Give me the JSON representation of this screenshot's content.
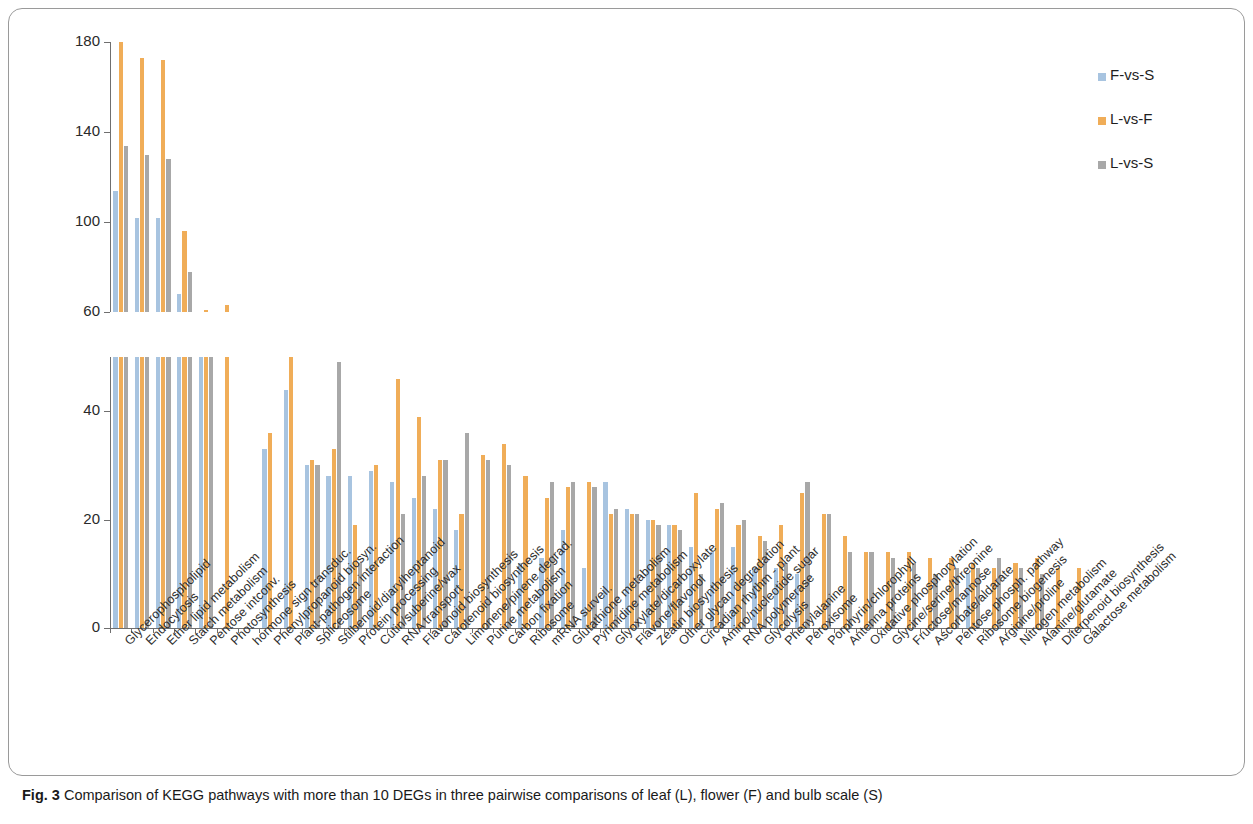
{
  "figure": {
    "caption_label": "Fig. 3",
    "caption_text": " Comparison of KEGG pathways with more than 10 DEGs in three pairwise comparisons of leaf (L), flower (F) and bulb scale (S)"
  },
  "legend": {
    "position": "right",
    "entries": [
      {
        "label": "F-vs-S",
        "color": "#a8c4e0"
      },
      {
        "label": "L-vs-F",
        "color": "#f0ad58"
      },
      {
        "label": "L-vs-S",
        "color": "#a8a8a8"
      }
    ]
  },
  "axes": {
    "upper": {
      "ticks": [
        "180",
        "140",
        "100",
        "60"
      ],
      "ylim": [
        60,
        180
      ]
    },
    "lower": {
      "ticks": [
        "40",
        "20",
        "0"
      ],
      "ylim": [
        0,
        50
      ]
    },
    "xlabel": "",
    "ylabel": "",
    "grid": false,
    "broken_axis": true
  },
  "chart_data": {
    "type": "bar",
    "title": "Comparison of KEGG pathways with more than 10 DEGs in three pairwise comparisons of leaf (L), flower (F) and bulb scale (S)",
    "xlabel": "",
    "ylabel": "Number of DEGs",
    "ylim_lower": [
      0,
      50
    ],
    "ylim_upper": [
      60,
      180
    ],
    "broken_axis": true,
    "grid": false,
    "legend_position": "right",
    "categories": [
      "Glycerophospholipid",
      "Endocytosis",
      "Ether lipid metabolism",
      "Starch metabolism",
      "Pentose intconv.",
      "Photosynthesis",
      "hormone sign transduc.",
      "Phenylpropanoid biosyn.",
      "Plant-pathogen interaction",
      "Spliceosome",
      "Stilbenoid/diarylheptanoid",
      "Protein processing",
      "Cutin/suberine/wax",
      "RNA transport",
      "Flavonoid biosynthesis",
      "Carotenoid biosynthesis",
      "Limonene/pinene degrad.",
      "Purine metabolism",
      "Carbon fixation",
      "Ribosome",
      "mRNA surveil.",
      "Glutathione metabolism",
      "Pyrimidine metabolism",
      "Glyoxylate/dicarboxylate",
      "Flavone/flavonol",
      "Zeatin biosynthesis",
      "Other glycan degradation",
      "Circadian rhythm - plant",
      "Amino/nucleotide sugar",
      "RNA polymerase",
      "Glycolysis",
      "Phenylalanine",
      "Peroxisome",
      "Porphyrin/chlorophyll",
      "Antenna proteins",
      "Oxidative phosphorylation",
      "Glycine/serine/threonine",
      "Fructose/mannose",
      "Ascorbate/aldarate",
      "Pentose phosph. pathway",
      "Ribosome biogenesis",
      "Arginine/proline",
      "Nitrogen metabolism",
      "Alanine/glutamate",
      "Diterpenoid biosynthesis",
      "Galactose metabolism"
    ],
    "series": [
      {
        "name": "F-vs-S",
        "color": "#a8c4e0",
        "values": [
          114,
          102,
          102,
          68,
          60,
          0,
          0,
          33,
          44,
          30,
          28,
          28,
          29,
          27,
          24,
          22,
          18,
          0,
          0,
          12,
          13,
          18,
          11,
          27,
          22,
          20,
          19,
          15,
          14,
          15,
          11,
          11,
          10,
          0,
          0,
          0,
          0,
          0,
          0,
          0,
          10,
          0,
          0,
          0,
          0,
          0
        ]
      },
      {
        "name": "L-vs-F",
        "color": "#f0ad58",
        "values": [
          180,
          173,
          172,
          96,
          61,
          63,
          0,
          36,
          52,
          31,
          33,
          19,
          30,
          46,
          39,
          31,
          21,
          32,
          34,
          28,
          24,
          26,
          27,
          21,
          21,
          20,
          19,
          25,
          22,
          19,
          17,
          19,
          25,
          21,
          17,
          14,
          14,
          14,
          13,
          13,
          12,
          11,
          12,
          13,
          11,
          11
        ]
      },
      {
        "name": "L-vs-S",
        "color": "#a8a8a8",
        "values": [
          134,
          130,
          128,
          78,
          60,
          0,
          0,
          0,
          0,
          30,
          49,
          12,
          0,
          21,
          28,
          31,
          36,
          31,
          30,
          0,
          27,
          27,
          26,
          22,
          21,
          19,
          18,
          10,
          23,
          20,
          16,
          12,
          27,
          21,
          14,
          14,
          13,
          12,
          10,
          11,
          11,
          13,
          11,
          10,
          0,
          0
        ]
      }
    ],
    "note": "First seven categories exceed the lower-panel limit of 50 and are drawn in the upper broken-axis panel; bars clipped at 50 in the lower panel."
  },
  "upper_panel_bars": {
    "categories": [
      "Glycerophospholipid",
      "Endocytosis",
      "Ether lipid metabolism",
      "Starch metabolism",
      "Pentose intconv.",
      "Photosynthesis",
      "hormone sign transduc."
    ],
    "F-vs-S": [
      114,
      102,
      102,
      68,
      60,
      null,
      null
    ],
    "L-vs-F": [
      180,
      173,
      172,
      96,
      61,
      null,
      63
    ],
    "L-vs-S": [
      134,
      130,
      128,
      78,
      60,
      null,
      null
    ]
  }
}
